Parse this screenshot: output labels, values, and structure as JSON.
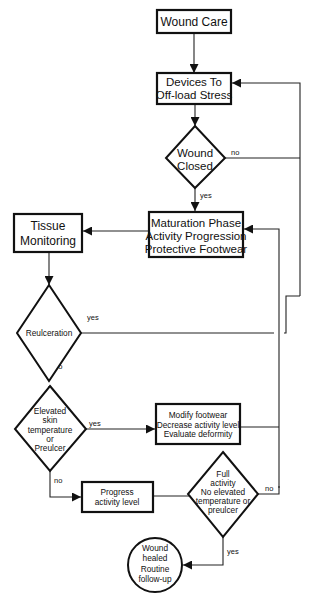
{
  "diagram": {
    "type": "flowchart",
    "nodes": {
      "wound_care": {
        "shape": "box",
        "lines": [
          "Wound Care"
        ]
      },
      "devices": {
        "shape": "box",
        "lines": [
          "Devices To",
          "Off-load Stress"
        ]
      },
      "wound_closed": {
        "shape": "diamond",
        "lines": [
          "Wound",
          "Closed"
        ]
      },
      "maturation": {
        "shape": "box",
        "lines": [
          "Maturation Phase",
          "Activity Progression",
          "Protective Footwear"
        ]
      },
      "tissue_monitoring": {
        "shape": "box",
        "lines": [
          "Tissue",
          "Monitoring"
        ]
      },
      "reulceration": {
        "shape": "diamond",
        "lines": [
          "Reulceration"
        ]
      },
      "elevated_skin": {
        "shape": "diamond",
        "lines": [
          "Elevated",
          "skin",
          "temperature",
          "or",
          "Preulcer"
        ]
      },
      "modify_footwear": {
        "shape": "box",
        "lines": [
          "Modify footwear",
          "Decrease activity level",
          "Evaluate deformity"
        ]
      },
      "progress_activity": {
        "shape": "box",
        "lines": [
          "Progress",
          "activity level"
        ]
      },
      "full_activity": {
        "shape": "diamond",
        "lines": [
          "Full",
          "activity",
          "No elevated",
          "temperature or",
          "preulcer"
        ]
      },
      "wound_healed": {
        "shape": "circle",
        "lines": [
          "Wound",
          "healed",
          "Routine",
          "follow-up"
        ]
      }
    },
    "edge_labels": {
      "closed_no": "no",
      "closed_yes": "yes",
      "reulc_yes": "yes",
      "reulc_no": "no",
      "elev_yes": "yes",
      "elev_no": "no",
      "full_no": "no",
      "full_yes": "yes"
    },
    "edges": [
      {
        "from": "wound_care",
        "to": "devices",
        "label": ""
      },
      {
        "from": "devices",
        "to": "wound_closed",
        "label": ""
      },
      {
        "from": "wound_closed",
        "to": "maturation",
        "label": "yes"
      },
      {
        "from": "wound_closed",
        "to": "devices",
        "label": "no"
      },
      {
        "from": "maturation",
        "to": "tissue_monitoring",
        "label": ""
      },
      {
        "from": "tissue_monitoring",
        "to": "reulceration",
        "label": ""
      },
      {
        "from": "reulceration",
        "to": "devices",
        "label": "yes"
      },
      {
        "from": "reulceration",
        "to": "elevated_skin",
        "label": "no"
      },
      {
        "from": "elevated_skin",
        "to": "modify_footwear",
        "label": "yes"
      },
      {
        "from": "elevated_skin",
        "to": "progress_activity",
        "label": "no"
      },
      {
        "from": "modify_footwear",
        "to": "maturation",
        "label": ""
      },
      {
        "from": "progress_activity",
        "to": "full_activity",
        "label": ""
      },
      {
        "from": "full_activity",
        "to": "maturation",
        "label": "no"
      },
      {
        "from": "full_activity",
        "to": "wound_healed",
        "label": "yes"
      }
    ]
  }
}
